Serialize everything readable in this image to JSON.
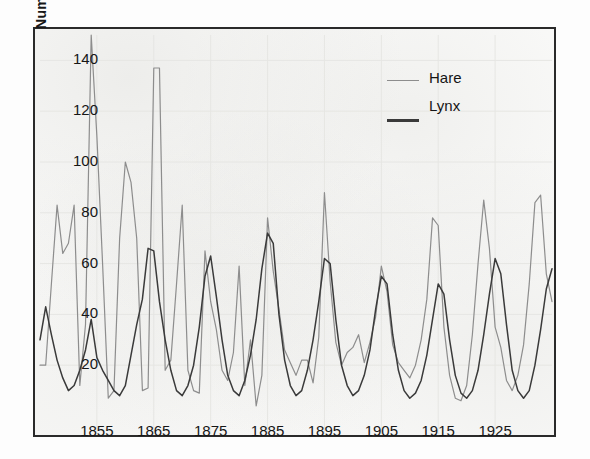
{
  "figure": {
    "y_axis_title_bold": "Number",
    "y_axis_title_rest": " (thousands)"
  },
  "legend": {
    "items": [
      {
        "label": "Hare",
        "color": "#8d8d8d",
        "style": "thin-line"
      },
      {
        "label": "Lynx",
        "color": "#3a3a3a",
        "style": "thick-line"
      }
    ]
  },
  "chart_data": {
    "type": "line",
    "title": "",
    "xlabel": "",
    "ylabel": "Number (thousands)",
    "xlim": [
      1845,
      1935
    ],
    "ylim": [
      0,
      150
    ],
    "xticks": [
      1855,
      1865,
      1875,
      1885,
      1895,
      1905,
      1915,
      1925
    ],
    "yticks": [
      20,
      40,
      60,
      80,
      100,
      120,
      140
    ],
    "grid": true,
    "legend_position": "top-right",
    "x": [
      1845,
      1846,
      1847,
      1848,
      1849,
      1850,
      1851,
      1852,
      1853,
      1854,
      1855,
      1856,
      1857,
      1858,
      1859,
      1860,
      1861,
      1862,
      1863,
      1864,
      1865,
      1866,
      1867,
      1868,
      1869,
      1870,
      1871,
      1872,
      1873,
      1874,
      1875,
      1876,
      1877,
      1878,
      1879,
      1880,
      1881,
      1882,
      1883,
      1884,
      1885,
      1886,
      1887,
      1888,
      1889,
      1890,
      1891,
      1892,
      1893,
      1894,
      1895,
      1896,
      1897,
      1898,
      1899,
      1900,
      1901,
      1902,
      1903,
      1904,
      1905,
      1906,
      1907,
      1908,
      1909,
      1910,
      1911,
      1912,
      1913,
      1914,
      1915,
      1916,
      1917,
      1918,
      1919,
      1920,
      1921,
      1922,
      1923,
      1924,
      1925,
      1926,
      1927,
      1928,
      1929,
      1930,
      1931,
      1932,
      1933,
      1934,
      1935
    ],
    "series": [
      {
        "name": "Hare",
        "color": "#8d8d8d",
        "values": [
          20,
          20,
          52,
          83,
          64,
          68,
          83,
          12,
          36,
          150,
          110,
          60,
          7,
          10,
          70,
          100,
          92,
          70,
          10,
          11,
          137,
          137,
          18,
          22,
          52,
          83,
          18,
          10,
          9,
          65,
          45,
          34,
          18,
          14,
          25,
          59,
          12,
          30,
          4,
          16,
          78,
          57,
          42,
          26,
          21,
          16,
          22,
          22,
          13,
          31,
          88,
          53,
          29,
          20,
          25,
          27,
          32,
          21,
          29,
          39,
          59,
          49,
          28,
          21,
          18,
          15,
          20,
          30,
          46,
          78,
          75,
          35,
          16,
          7,
          6,
          12,
          32,
          60,
          85,
          66,
          35,
          27,
          14,
          10,
          16,
          28,
          52,
          84,
          87,
          56,
          45
        ]
      },
      {
        "name": "Lynx",
        "color": "#3a3a3a",
        "values": [
          30,
          43,
          32,
          22,
          15,
          10,
          12,
          18,
          26,
          38,
          23,
          18,
          14,
          10,
          8,
          12,
          24,
          36,
          46,
          66,
          65,
          45,
          30,
          18,
          10,
          8,
          12,
          20,
          35,
          55,
          63,
          47,
          30,
          16,
          10,
          8,
          14,
          24,
          38,
          58,
          72,
          68,
          40,
          22,
          12,
          8,
          10,
          18,
          30,
          45,
          62,
          60,
          38,
          20,
          12,
          8,
          10,
          16,
          26,
          42,
          55,
          52,
          32,
          18,
          10,
          7,
          9,
          14,
          24,
          38,
          52,
          48,
          30,
          16,
          9,
          7,
          10,
          18,
          32,
          48,
          62,
          56,
          36,
          18,
          10,
          7,
          10,
          20,
          34,
          50,
          58
        ]
      }
    ]
  }
}
